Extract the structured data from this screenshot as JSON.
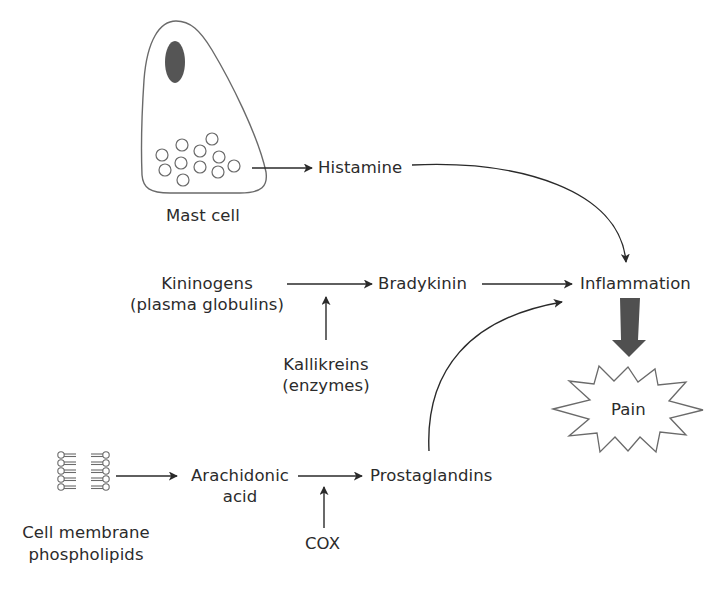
{
  "diagram": {
    "nodes": {
      "mast_cell": {
        "label": "Mast cell"
      },
      "histamine": {
        "label": "Histamine"
      },
      "kininogens": {
        "line1": "Kininogens",
        "line2": "(plasma globulins)"
      },
      "bradykinin": {
        "label": "Bradykinin"
      },
      "kallikreins": {
        "line1": "Kallikreins",
        "line2": "(enzymes)"
      },
      "inflammation": {
        "label": "Inflammation"
      },
      "pain": {
        "label": "Pain"
      },
      "phospholipids": {
        "line1": "Cell membrane",
        "line2": "phospholipids"
      },
      "arachidonic_acid": {
        "line1": "Arachidonic",
        "line2": "acid"
      },
      "prostaglandins": {
        "label": "Prostaglandins"
      },
      "cox": {
        "label": "COX"
      }
    },
    "edges": [
      {
        "from": "mast_cell",
        "to": "histamine",
        "type": "arrow"
      },
      {
        "from": "histamine",
        "to": "inflammation",
        "type": "curved-arrow"
      },
      {
        "from": "kininogens",
        "to": "bradykinin",
        "type": "arrow"
      },
      {
        "from": "kallikreins",
        "to": "kininogens-bradykinin",
        "type": "catalyst-arrow"
      },
      {
        "from": "bradykinin",
        "to": "inflammation",
        "type": "arrow"
      },
      {
        "from": "phospholipids",
        "to": "arachidonic_acid",
        "type": "arrow"
      },
      {
        "from": "arachidonic_acid",
        "to": "prostaglandins",
        "type": "arrow"
      },
      {
        "from": "cox",
        "to": "arachidonic_acid-prostaglandins",
        "type": "catalyst-arrow"
      },
      {
        "from": "prostaglandins",
        "to": "inflammation",
        "type": "curved-arrow"
      },
      {
        "from": "inflammation",
        "to": "pain",
        "type": "thick-arrow"
      }
    ],
    "colors": {
      "line": "#2a2a2a",
      "outline": "#6a6a6a",
      "nucleus": "#555555",
      "thick_arrow": "#505050",
      "background": "#ffffff"
    }
  }
}
